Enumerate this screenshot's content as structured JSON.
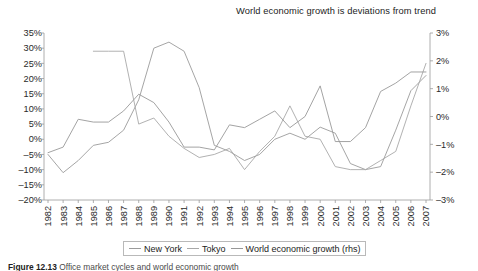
{
  "figure": {
    "note_title": "World economic growth is deviations from trend",
    "caption_prefix": "Figure 12.13",
    "caption_text": "Office market cycles and world economic growth"
  },
  "legend": {
    "position": "bottom-center",
    "entries": [
      {
        "label": "New York",
        "color": "#9b9b9b"
      },
      {
        "label": "Tokyo",
        "color": "#a8a8a8"
      },
      {
        "label": "World economic growth (rhs)",
        "color": "#989898"
      }
    ]
  },
  "chart_data": {
    "type": "line",
    "title": "",
    "subtitle": "World economic growth is deviations from trend",
    "xlabel": "",
    "ylabel": "",
    "y2label": "",
    "grid": false,
    "legend_position": "bottom",
    "x": [
      1982,
      1983,
      1984,
      1985,
      1986,
      1987,
      1988,
      1989,
      1990,
      1991,
      1992,
      1993,
      1994,
      1995,
      1996,
      1997,
      1998,
      1999,
      2000,
      2001,
      2002,
      2003,
      2004,
      2005,
      2006,
      2007
    ],
    "xtick_labels": [
      "1982",
      "1983",
      "1984",
      "1985",
      "1986",
      "1987",
      "1988",
      "1989",
      "1990",
      "1991",
      "1992",
      "1993",
      "1994",
      "1995",
      "1996",
      "1997",
      "1998",
      "1999",
      "2000",
      "2001",
      "2002",
      "2003",
      "2004",
      "2005",
      "2006",
      "2007"
    ],
    "ylim": [
      -20,
      35
    ],
    "ytick_labels": [
      "35%",
      "30%",
      "25%",
      "20%",
      "15%",
      "10%",
      "5%",
      "0%",
      "-5%",
      "-10%",
      "-15%",
      "-20%"
    ],
    "yticks": [
      35,
      30,
      25,
      20,
      15,
      10,
      5,
      0,
      -5,
      -10,
      -15,
      -20
    ],
    "y2lim": [
      -3,
      3
    ],
    "y2tick_labels": [
      "3%",
      "2%",
      "1%",
      "0%",
      "-1%",
      "-2%",
      "-3%"
    ],
    "y2ticks": [
      3,
      2,
      1,
      0,
      -1,
      -2,
      -3
    ],
    "series": [
      {
        "name": "New York",
        "axis": "left",
        "unit": "%",
        "color": "#9b9b9b",
        "x": [
          1982,
          1983,
          1984,
          1985,
          1986,
          1987,
          1988,
          1989,
          1990,
          1991,
          1992,
          1993,
          1994,
          1995,
          1996,
          1997,
          1998,
          1999,
          2000,
          2001,
          2002,
          2003,
          2004,
          2005,
          2006,
          2007
        ],
        "values": [
          -5,
          -11,
          -7,
          -2,
          -1,
          3,
          13,
          30,
          32,
          29,
          17,
          -2,
          -4,
          -7,
          -5,
          0,
          2,
          0,
          4,
          2,
          -8,
          -10,
          -9,
          3,
          16,
          21
        ]
      },
      {
        "name": "Tokyo",
        "axis": "left",
        "unit": "%",
        "color": "#a8a8a8",
        "x": [
          1985,
          1986,
          1987,
          1988,
          1989,
          1990,
          1991,
          1992,
          1993,
          1994,
          1995,
          1996,
          1997,
          1998,
          1999,
          2000,
          2001,
          2002,
          2003,
          2004,
          2005,
          2006,
          2007
        ],
        "values": [
          29,
          29,
          29,
          5,
          7,
          1,
          -3,
          -6,
          -5,
          -3,
          -10,
          -4,
          1,
          11,
          1,
          0,
          -9,
          -10,
          -10,
          -7,
          -4,
          11,
          25
        ]
      },
      {
        "name": "World economic growth (rhs)",
        "axis": "right",
        "unit": "%",
        "color": "#989898",
        "x": [
          1982,
          1983,
          1984,
          1985,
          1986,
          1987,
          1988,
          1989,
          1990,
          1991,
          1992,
          1993,
          1994,
          1995,
          1996,
          1997,
          1998,
          1999,
          2000,
          2001,
          2002,
          2003,
          2004,
          2005,
          2006,
          2007
        ],
        "values": [
          -1.3,
          -1.1,
          -0.1,
          -0.2,
          -0.2,
          0.2,
          0.8,
          0.5,
          -0.2,
          -1.1,
          -1.1,
          -1.2,
          -0.3,
          -0.4,
          -0.1,
          0.2,
          -0.4,
          0.0,
          1.1,
          -0.9,
          -0.9,
          -0.4,
          0.9,
          1.2,
          1.6,
          1.6
        ]
      }
    ]
  }
}
